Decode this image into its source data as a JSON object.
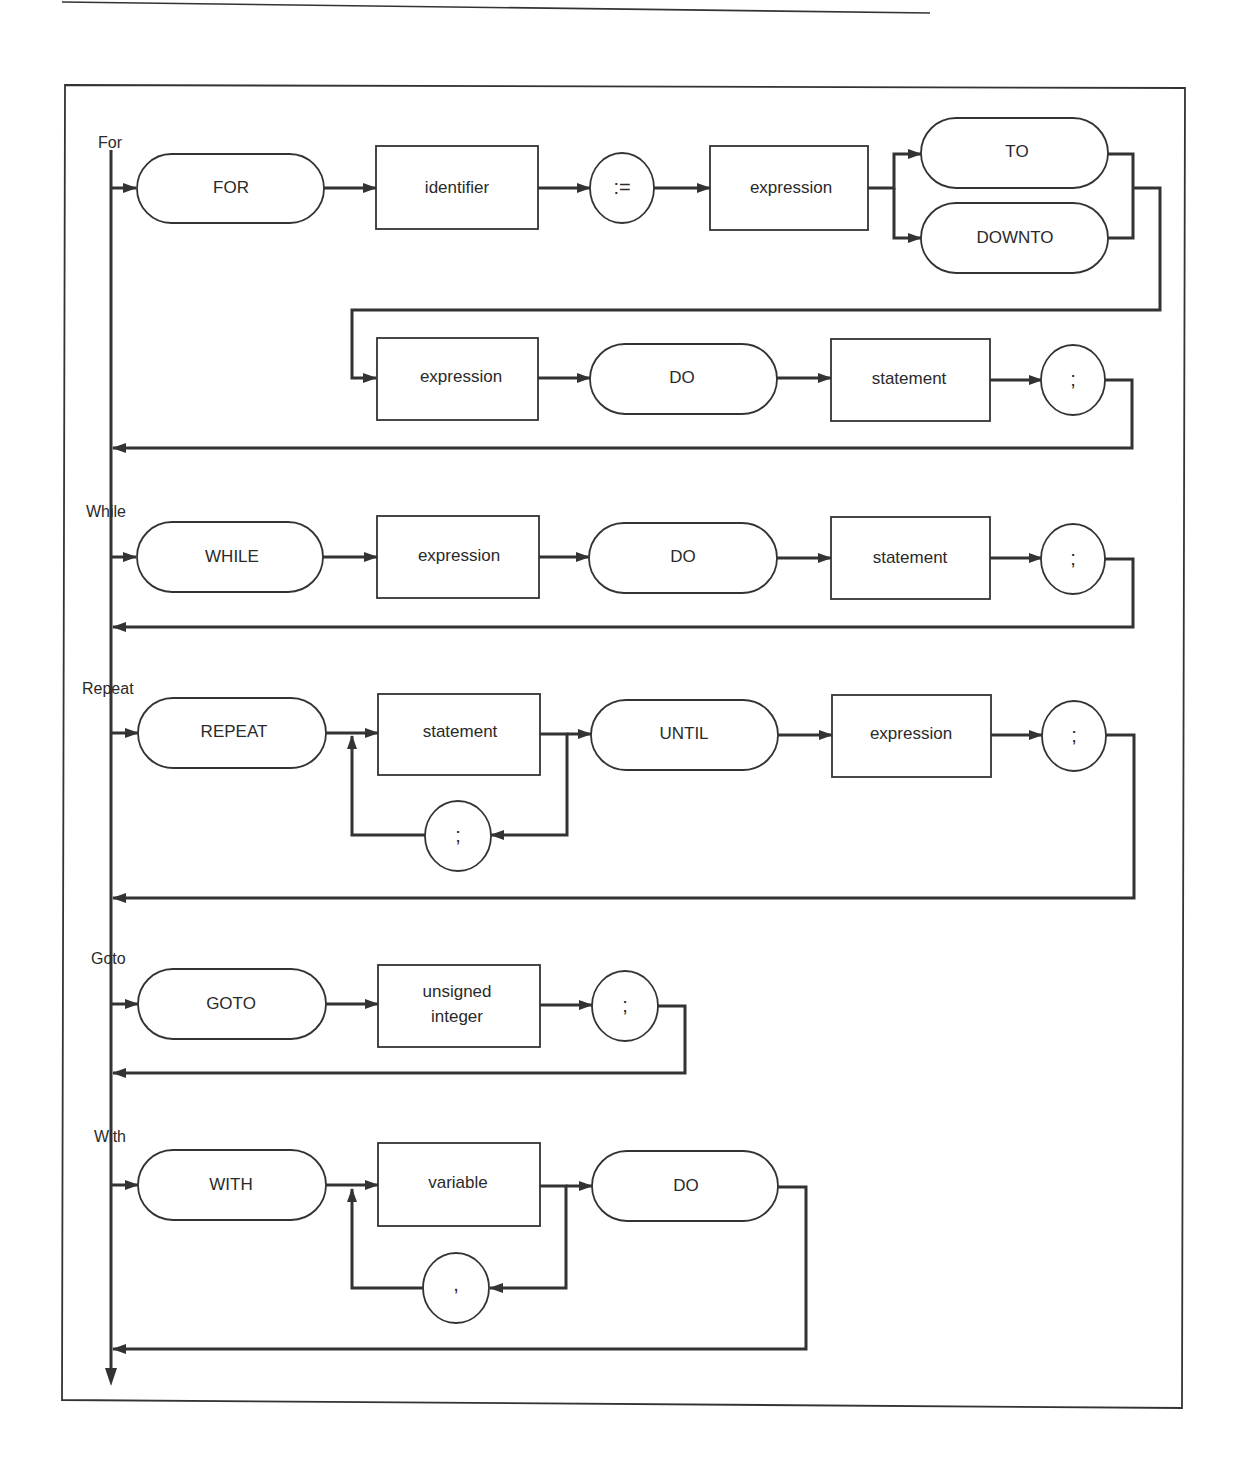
{
  "diagram": {
    "type": "syntax-diagram",
    "colors": {
      "ink": "#333333",
      "background": "#ffffff"
    },
    "sections": [
      {
        "label": "For",
        "nodes": {
          "for_kw": "FOR",
          "identifier": "identifier",
          "assign": ":=",
          "expression1": "expression",
          "to_kw": "TO",
          "downto_kw": "DOWNTO",
          "expression2": "expression",
          "do_kw": "DO",
          "statement": "statement",
          "semicolon": ";"
        }
      },
      {
        "label": "While",
        "nodes": {
          "while_kw": "WHILE",
          "expression": "expression",
          "do_kw": "DO",
          "statement": "statement",
          "semicolon": ";"
        }
      },
      {
        "label": "Repeat",
        "nodes": {
          "repeat_kw": "REPEAT",
          "statement": "statement",
          "loop_semicolon": ";",
          "until_kw": "UNTIL",
          "expression": "expression",
          "semicolon": ";"
        }
      },
      {
        "label": "Goto",
        "nodes": {
          "goto_kw": "GOTO",
          "unsigned_line1": "unsigned",
          "unsigned_line2": "integer",
          "semicolon": ";"
        }
      },
      {
        "label": "With",
        "nodes": {
          "with_kw": "WITH",
          "variable": "variable",
          "loop_comma": ",",
          "do_kw": "DO"
        }
      }
    ]
  }
}
